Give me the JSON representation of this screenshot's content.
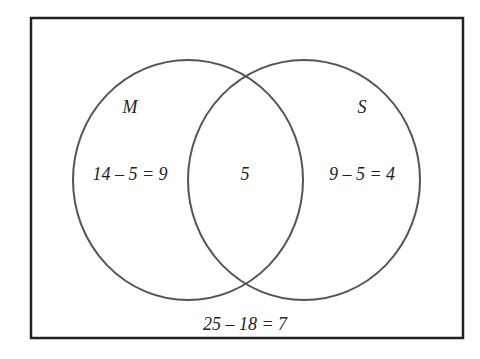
{
  "diagram": {
    "type": "venn",
    "sets": [
      {
        "name": "M",
        "label": "M",
        "only_region": "14 – 5 = 9"
      },
      {
        "name": "S",
        "label": "S",
        "only_region": "9 – 5 = 4"
      }
    ],
    "intersection": "5",
    "outside": "25 – 18 = 7",
    "colors": {
      "stroke": "#555555",
      "border": "#222222",
      "text": "#222222"
    }
  }
}
